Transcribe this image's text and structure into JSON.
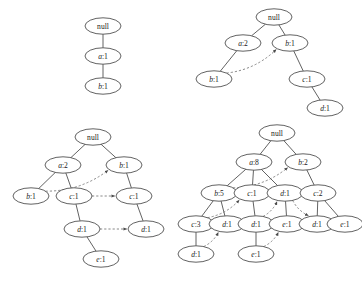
{
  "figure": {
    "caption": "",
    "width": 362,
    "height": 281,
    "background": "#ffffff",
    "node_stroke": "#3a3a3a",
    "edge_stroke": "#3a3a3a",
    "link_stroke": "#6b6b6b",
    "text_color": "#1a1a1a"
  },
  "trees": [
    {
      "id": "tree-1",
      "name": "fp-tree-stage-1",
      "nodes": [
        {
          "id": "t1n0",
          "label": "null",
          "italic_prefix": "",
          "cx": 103,
          "cy": 26
        },
        {
          "id": "t1n1",
          "label": "a:1",
          "italic_prefix": "a",
          "cx": 103,
          "cy": 56
        },
        {
          "id": "t1n2",
          "label": "b:1",
          "italic_prefix": "b",
          "cx": 103,
          "cy": 86
        }
      ],
      "edges": [
        {
          "from": "t1n0",
          "to": "t1n1"
        },
        {
          "from": "t1n1",
          "to": "t1n2"
        }
      ],
      "links": []
    },
    {
      "id": "tree-2",
      "name": "fp-tree-stage-2",
      "nodes": [
        {
          "id": "t2n0",
          "label": "null",
          "italic_prefix": "",
          "cx": 274,
          "cy": 17
        },
        {
          "id": "t2n1",
          "label": "a:2",
          "italic_prefix": "a",
          "cx": 243,
          "cy": 43
        },
        {
          "id": "t2n2",
          "label": "b:1",
          "italic_prefix": "b",
          "cx": 290,
          "cy": 43
        },
        {
          "id": "t2n3",
          "label": "b:1",
          "italic_prefix": "b",
          "cx": 214,
          "cy": 79
        },
        {
          "id": "t2n4",
          "label": "c:1",
          "italic_prefix": "c",
          "cx": 307,
          "cy": 79
        },
        {
          "id": "t2n5",
          "label": "d:1",
          "italic_prefix": "d",
          "cx": 325,
          "cy": 108
        }
      ],
      "edges": [
        {
          "from": "t2n0",
          "to": "t2n1"
        },
        {
          "from": "t2n0",
          "to": "t2n2"
        },
        {
          "from": "t2n1",
          "to": "t2n3"
        },
        {
          "from": "t2n2",
          "to": "t2n4"
        },
        {
          "from": "t2n4",
          "to": "t2n5"
        }
      ],
      "links": [
        {
          "from": "t2n3",
          "to": "t2n2",
          "curve": "arc"
        }
      ]
    },
    {
      "id": "tree-3",
      "name": "fp-tree-stage-3",
      "nodes": [
        {
          "id": "t3n0",
          "label": "null",
          "italic_prefix": "",
          "cx": 93,
          "cy": 137
        },
        {
          "id": "t3n1",
          "label": "a:2",
          "italic_prefix": "a",
          "cx": 63,
          "cy": 165
        },
        {
          "id": "t3n2",
          "label": "b:1",
          "italic_prefix": "b",
          "cx": 124,
          "cy": 165
        },
        {
          "id": "t3n3",
          "label": "b:1",
          "italic_prefix": "b",
          "cx": 31,
          "cy": 196
        },
        {
          "id": "t3n4",
          "label": "c:1",
          "italic_prefix": "c",
          "cx": 74,
          "cy": 196
        },
        {
          "id": "t3n5",
          "label": "c:1",
          "italic_prefix": "c",
          "cx": 134,
          "cy": 196
        },
        {
          "id": "t3n6",
          "label": "d:1",
          "italic_prefix": "d",
          "cx": 82,
          "cy": 229
        },
        {
          "id": "t3n7",
          "label": "d:1",
          "italic_prefix": "d",
          "cx": 146,
          "cy": 229
        },
        {
          "id": "t3n8",
          "label": "e:1",
          "italic_prefix": "e",
          "cx": 101,
          "cy": 259
        }
      ],
      "edges": [
        {
          "from": "t3n0",
          "to": "t3n1"
        },
        {
          "from": "t3n0",
          "to": "t3n2"
        },
        {
          "from": "t3n1",
          "to": "t3n3"
        },
        {
          "from": "t3n1",
          "to": "t3n4"
        },
        {
          "from": "t3n2",
          "to": "t3n5"
        },
        {
          "from": "t3n4",
          "to": "t3n6"
        },
        {
          "from": "t3n5",
          "to": "t3n7"
        },
        {
          "from": "t3n6",
          "to": "t3n8"
        }
      ],
      "links": [
        {
          "from": "t3n3",
          "to": "t3n2",
          "curve": "arc"
        },
        {
          "from": "t3n4",
          "to": "t3n5",
          "curve": "straight"
        },
        {
          "from": "t3n6",
          "to": "t3n7",
          "curve": "straight"
        }
      ]
    },
    {
      "id": "tree-4",
      "name": "fp-tree-stage-4",
      "nodes": [
        {
          "id": "t4n0",
          "label": "null",
          "italic_prefix": "",
          "cx": 277,
          "cy": 133
        },
        {
          "id": "t4n1",
          "label": "a:8",
          "italic_prefix": "a",
          "cx": 254,
          "cy": 162
        },
        {
          "id": "t4n2",
          "label": "b:2",
          "italic_prefix": "b",
          "cx": 303,
          "cy": 162
        },
        {
          "id": "t4n3",
          "label": "b:5",
          "italic_prefix": "b",
          "cx": 219,
          "cy": 193
        },
        {
          "id": "t4n4",
          "label": "c:1",
          "italic_prefix": "c",
          "cx": 252,
          "cy": 193
        },
        {
          "id": "t4n5",
          "label": "d:1",
          "italic_prefix": "d",
          "cx": 285,
          "cy": 193
        },
        {
          "id": "t4n6",
          "label": "c:2",
          "italic_prefix": "c",
          "cx": 318,
          "cy": 193
        },
        {
          "id": "t4n7",
          "label": "c:3",
          "italic_prefix": "c",
          "cx": 196,
          "cy": 224
        },
        {
          "id": "t4n8",
          "label": "d:1",
          "italic_prefix": "d",
          "cx": 227,
          "cy": 224
        },
        {
          "id": "t4n9",
          "label": "d:1",
          "italic_prefix": "d",
          "cx": 256,
          "cy": 224
        },
        {
          "id": "t4n10",
          "label": "e:1",
          "italic_prefix": "e",
          "cx": 287,
          "cy": 224
        },
        {
          "id": "t4n11",
          "label": "d:1",
          "italic_prefix": "d",
          "cx": 317,
          "cy": 224
        },
        {
          "id": "t4n12",
          "label": "e:1",
          "italic_prefix": "e",
          "cx": 345,
          "cy": 224
        },
        {
          "id": "t4n13",
          "label": "d:1",
          "italic_prefix": "d",
          "cx": 196,
          "cy": 254
        },
        {
          "id": "t4n14",
          "label": "e:1",
          "italic_prefix": "e",
          "cx": 256,
          "cy": 254
        }
      ],
      "edges": [
        {
          "from": "t4n0",
          "to": "t4n1"
        },
        {
          "from": "t4n0",
          "to": "t4n2"
        },
        {
          "from": "t4n1",
          "to": "t4n3"
        },
        {
          "from": "t4n1",
          "to": "t4n4"
        },
        {
          "from": "t4n1",
          "to": "t4n5"
        },
        {
          "from": "t4n2",
          "to": "t4n6"
        },
        {
          "from": "t4n3",
          "to": "t4n7"
        },
        {
          "from": "t4n3",
          "to": "t4n8"
        },
        {
          "from": "t4n4",
          "to": "t4n9"
        },
        {
          "from": "t4n5",
          "to": "t4n10"
        },
        {
          "from": "t4n6",
          "to": "t4n11"
        },
        {
          "from": "t4n6",
          "to": "t4n12"
        },
        {
          "from": "t4n7",
          "to": "t4n13"
        },
        {
          "from": "t4n9",
          "to": "t4n14"
        }
      ],
      "links": [
        {
          "from": "t4n3",
          "to": "t4n2",
          "curve": "arc"
        },
        {
          "from": "t4n4",
          "to": "t4n6",
          "curve": "arc"
        },
        {
          "from": "t4n7",
          "to": "t4n4",
          "curve": "arc"
        },
        {
          "from": "t4n8",
          "to": "t4n9",
          "curve": "straight"
        },
        {
          "from": "t4n9",
          "to": "t4n5",
          "curve": "arc"
        },
        {
          "from": "t4n5",
          "to": "t4n11",
          "curve": "arc"
        },
        {
          "from": "t4n13",
          "to": "t4n8",
          "curve": "arc"
        },
        {
          "from": "t4n14",
          "to": "t4n10",
          "curve": "arc"
        },
        {
          "from": "t4n10",
          "to": "t4n12",
          "curve": "deep-arc"
        }
      ]
    }
  ]
}
